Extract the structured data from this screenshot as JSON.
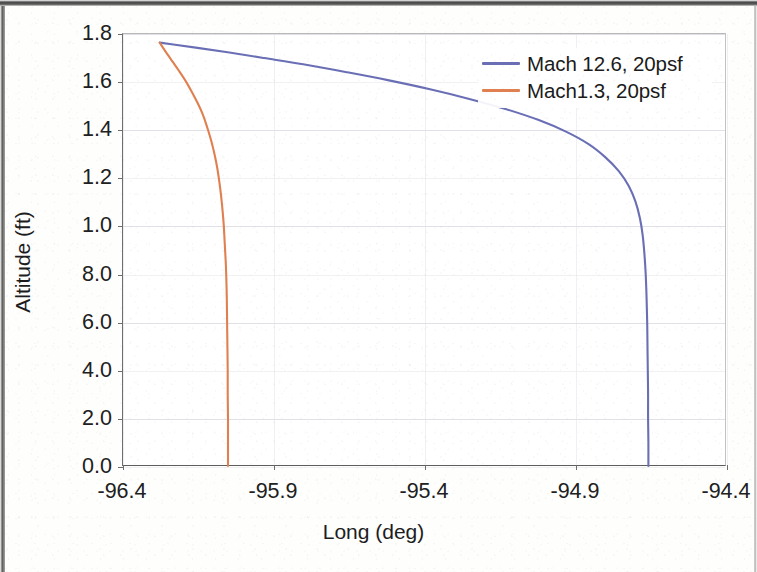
{
  "figure": {
    "background_color": "#ffffff",
    "page_background": "#fefefd"
  },
  "axes": {
    "x_title": "Long (deg)",
    "y_title": "Altitude (ft)",
    "x_tick_labels": [
      "-96.4",
      "-95.9",
      "-95.4",
      "-94.9",
      "-94.4"
    ],
    "y_tick_labels": [
      "1.8",
      "1.6",
      "1.4",
      "1.2",
      "1.0",
      "8.0",
      "6.0",
      "4.0",
      "2.0",
      "0.0"
    ]
  },
  "legend": {
    "entries": [
      {
        "label": "Mach 12.6, 20psf",
        "color": "#6a6fb5"
      },
      {
        "label": "Mach1.3, 20psf",
        "color": "#e08050"
      }
    ]
  },
  "chart_data": {
    "type": "line",
    "title": "",
    "subtitle": "",
    "xlabel": "Long (deg)",
    "ylabel": "Altitude (ft)",
    "xlim": [
      -96.4,
      -94.4
    ],
    "ylim": [
      0.0,
      18.0
    ],
    "x_ticks": [
      -96.4,
      -95.9,
      -95.4,
      -94.9,
      -94.4
    ],
    "x_tick_labels": [
      "-96.4",
      "-95.9",
      "-95.4",
      "-94.9",
      "-94.4"
    ],
    "y_ticks": [
      0.0,
      2.0,
      4.0,
      6.0,
      8.0,
      10.0,
      12.0,
      14.0,
      16.0,
      18.0
    ],
    "y_tick_labels": [
      "0.0",
      "2.0",
      "4.0",
      "6.0",
      "8.0",
      "1.0",
      "1.2",
      "1.4",
      "1.6",
      "1.8"
    ],
    "grid": "horizontal-faint",
    "legend_position": "top-right",
    "note": "y tick labels are rendered in the source figure as 1.0/1.2/1.4/1.6/1.8 for the 10/12/14/16/18 ft values",
    "series": [
      {
        "name": "Mach 12.6, 20psf",
        "color": "#6a6fb5",
        "points": [
          [
            -96.275,
            17.6
          ],
          [
            -96.23,
            17.52
          ],
          [
            -96.15,
            17.38
          ],
          [
            -96.05,
            17.2
          ],
          [
            -95.93,
            16.96
          ],
          [
            -95.8,
            16.7
          ],
          [
            -95.66,
            16.38
          ],
          [
            -95.52,
            16.04
          ],
          [
            -95.38,
            15.66
          ],
          [
            -95.25,
            15.26
          ],
          [
            -95.13,
            14.84
          ],
          [
            -95.02,
            14.38
          ],
          [
            -94.93,
            13.9
          ],
          [
            -94.855,
            13.38
          ],
          [
            -94.8,
            12.84
          ],
          [
            -94.755,
            12.26
          ],
          [
            -94.722,
            11.64
          ],
          [
            -94.7,
            11.0
          ],
          [
            -94.685,
            10.3
          ],
          [
            -94.676,
            9.6
          ],
          [
            -94.67,
            8.8
          ],
          [
            -94.666,
            8.0
          ],
          [
            -94.663,
            7.0
          ],
          [
            -94.661,
            6.0
          ],
          [
            -94.66,
            5.0
          ],
          [
            -94.659,
            4.0
          ],
          [
            -94.658,
            3.0
          ],
          [
            -94.658,
            2.0
          ],
          [
            -94.657,
            1.0
          ],
          [
            -94.657,
            0.0
          ]
        ]
      },
      {
        "name": "Mach1.3, 20psf",
        "color": "#e08050",
        "points": [
          [
            -96.275,
            17.6
          ],
          [
            -96.265,
            17.4
          ],
          [
            -96.25,
            17.12
          ],
          [
            -96.232,
            16.8
          ],
          [
            -96.212,
            16.44
          ],
          [
            -96.19,
            16.02
          ],
          [
            -96.17,
            15.58
          ],
          [
            -96.15,
            15.1
          ],
          [
            -96.132,
            14.6
          ],
          [
            -96.118,
            14.08
          ],
          [
            -96.105,
            13.54
          ],
          [
            -96.094,
            12.98
          ],
          [
            -96.085,
            12.42
          ],
          [
            -96.078,
            11.84
          ],
          [
            -96.072,
            11.24
          ],
          [
            -96.067,
            10.62
          ],
          [
            -96.063,
            10.0
          ],
          [
            -96.06,
            9.3
          ],
          [
            -96.057,
            8.6
          ],
          [
            -96.055,
            8.0
          ],
          [
            -96.053,
            7.0
          ],
          [
            -96.052,
            6.0
          ],
          [
            -96.051,
            5.0
          ],
          [
            -96.05,
            4.0
          ],
          [
            -96.05,
            3.0
          ],
          [
            -96.049,
            2.0
          ],
          [
            -96.049,
            1.0
          ],
          [
            -96.049,
            0.0
          ]
        ]
      }
    ]
  }
}
